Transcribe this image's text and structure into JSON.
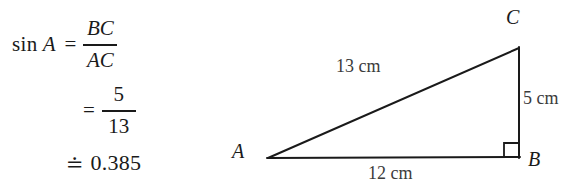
{
  "solution": {
    "line1": {
      "function_label": "sin",
      "angle": "A",
      "equals": "=",
      "numerator": "BC",
      "denominator": "AC"
    },
    "line2": {
      "equals": "=",
      "numerator": "5",
      "denominator": "13"
    },
    "line3": {
      "approx_equals": "≐",
      "value": "0.385"
    }
  },
  "figure": {
    "vertices": {
      "A": "A",
      "B": "B",
      "C": "C"
    },
    "sides": {
      "hypotenuse_ac": "13 cm",
      "opposite_bc": "5 cm",
      "adjacent_ab": "12 cm"
    },
    "right_angle_at": "B",
    "colors": {
      "stroke": "#1a1a1a",
      "side_label_text": "#3b3b3b",
      "background": "#ffffff"
    },
    "geometry": {
      "A": [
        78,
        158
      ],
      "B": [
        329,
        157
      ],
      "C": [
        329,
        48
      ],
      "right_angle_marker_size": 15
    }
  }
}
